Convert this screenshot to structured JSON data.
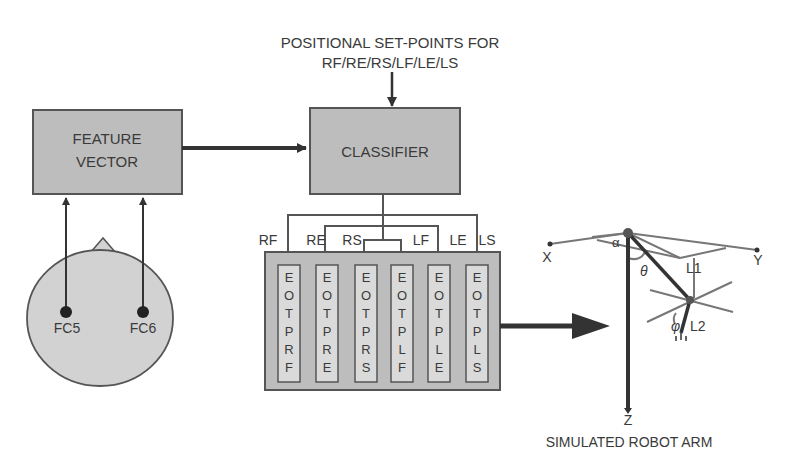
{
  "diagram": {
    "setpoints_label": {
      "line1": "POSITIONAL SET-POINTS FOR",
      "line2": "RF/RE/RS/LF/LE/LS"
    },
    "feature_vector": {
      "line1": "FEATURE",
      "line2": "VECTOR"
    },
    "classifier": {
      "label": "CLASSIFIER"
    },
    "electrodes": [
      {
        "label": "FC5"
      },
      {
        "label": "FC6"
      }
    ],
    "outputs": [
      {
        "label": "RF",
        "eotp": "EOTPRF"
      },
      {
        "label": "RE",
        "eotp": "EOTPRE"
      },
      {
        "label": "RS",
        "eotp": "EOTPRS"
      },
      {
        "label": "LF",
        "eotp": "EOTPLF"
      },
      {
        "label": "LE",
        "eotp": "EOTPLE"
      },
      {
        "label": "LS",
        "eotp": "EOTPLS"
      }
    ],
    "robot": {
      "caption": "SIMULATED ROBOT ARM",
      "axis_x": "X",
      "axis_y": "Y",
      "axis_z": "Z",
      "link1": "L1",
      "link2": "L2",
      "angle_alpha": "α",
      "angle_theta": "θ",
      "angle_phi": "φ"
    },
    "colors": {
      "box_fill": "#bdbdbd",
      "box_stroke": "#555555",
      "line": "#333333",
      "head_fill": "#d2d2d2"
    }
  }
}
